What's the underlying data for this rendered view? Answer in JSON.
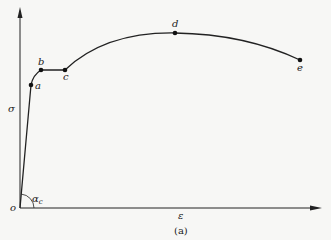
{
  "diagram": {
    "type": "stress-strain curve",
    "caption": "(a)",
    "axes": {
      "y_label": "σ",
      "x_label": "ε",
      "origin_label": "o",
      "angle_label": "α",
      "angle_subscript": "c"
    },
    "points": [
      {
        "id": "a",
        "label": "a",
        "x": 31,
        "y": 85
      },
      {
        "id": "b",
        "label": "b",
        "x": 41,
        "y": 70
      },
      {
        "id": "c",
        "label": "c",
        "x": 65,
        "y": 70
      },
      {
        "id": "d",
        "label": "d",
        "x": 175,
        "y": 33
      },
      {
        "id": "e",
        "label": "e",
        "x": 300,
        "y": 60
      }
    ],
    "colors": {
      "background": "#f7f7f5",
      "line": "#222222"
    }
  }
}
